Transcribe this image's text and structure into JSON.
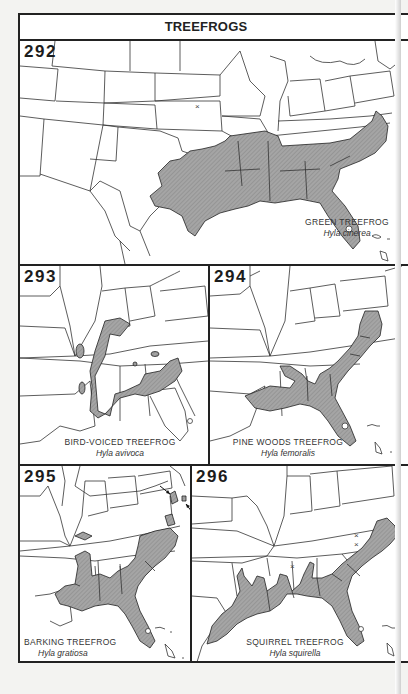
{
  "page": {
    "title": "TREEFROGS"
  },
  "maps": [
    {
      "number": "292",
      "common_name": "GREEN TREEFROG",
      "scientific_name": "Hyla cinerea",
      "markers": [
        "isolated record x in Missouri/Kansas area"
      ]
    },
    {
      "number": "293",
      "common_name": "BIRD-VOICED TREEFROG",
      "scientific_name": "Hyla avivoca"
    },
    {
      "number": "294",
      "common_name": "PINE WOODS TREEFROG",
      "scientific_name": "Hyla femoralis"
    },
    {
      "number": "295",
      "common_name": "BARKING TREEFROG",
      "scientific_name": "Hyla gratiosa",
      "markers": [
        "two arrows pointing to isolated populations in Delmarva"
      ]
    },
    {
      "number": "296",
      "common_name": "SQUIRREL TREEFROG",
      "scientific_name": "Hyla squirella",
      "markers": [
        "isolated record x marks in Virginia/North Carolina and Mississippi"
      ]
    }
  ],
  "colors": {
    "border": "#222222",
    "range_fill": "#9a9a9a",
    "paper": "#ffffff",
    "background": "#f3f3f1"
  }
}
